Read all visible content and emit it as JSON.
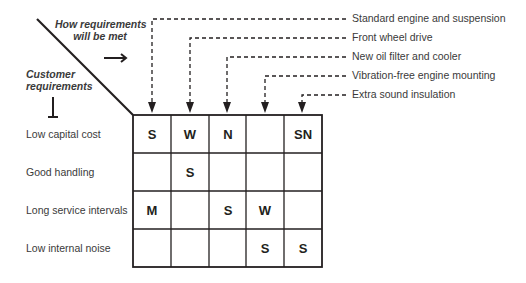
{
  "diagram": {
    "corner": {
      "columns_heading": [
        "How requirements",
        "will be met"
      ],
      "rows_heading": [
        "Customer",
        "requirements"
      ]
    },
    "columns": [
      {
        "label": "Standard engine and suspension"
      },
      {
        "label": "Front wheel drive"
      },
      {
        "label": "New oil filter and cooler"
      },
      {
        "label": "Vibration-free engine mounting"
      },
      {
        "label": "Extra sound insulation"
      }
    ],
    "rows": [
      {
        "label": "Low capital cost",
        "cells": [
          "S",
          "W",
          "N",
          "",
          "SN"
        ]
      },
      {
        "label": "Good handling",
        "cells": [
          "",
          "S",
          "",
          "",
          ""
        ]
      },
      {
        "label": "Long service intervals",
        "cells": [
          "M",
          "",
          "S",
          "W",
          ""
        ]
      },
      {
        "label": "Low internal noise",
        "cells": [
          "",
          "",
          "",
          "S",
          "S"
        ]
      }
    ],
    "colors": {
      "line": "#231f20",
      "text": "#3a3a3a"
    }
  }
}
